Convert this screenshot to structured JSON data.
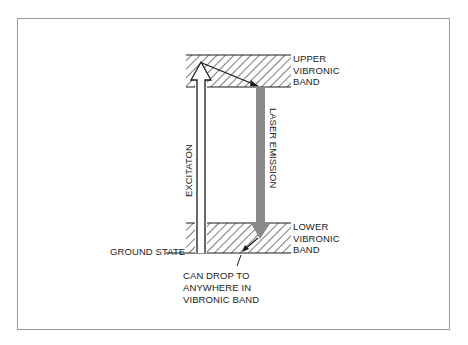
{
  "diagram": {
    "type": "energy-level diagram",
    "upper_band": {
      "label_lines": [
        "UPPER",
        "VIBRONIC",
        "BAND"
      ]
    },
    "lower_band": {
      "label_lines": [
        "LOWER",
        "VIBRONIC",
        "BAND"
      ]
    },
    "ground_state_label": "GROUND STATE",
    "excitation_label": "EXCITATON",
    "laser_emission_label": "LASER EMISSION",
    "drop_note_lines": [
      "CAN DROP TO",
      "ANYWHERE IN",
      "VIBRONIC BAND"
    ],
    "colors": {
      "line": "#1a1a1a",
      "hatch": "#333333",
      "laser_arrow": "#8a8a8a",
      "frame": "#9a9a9a"
    }
  }
}
